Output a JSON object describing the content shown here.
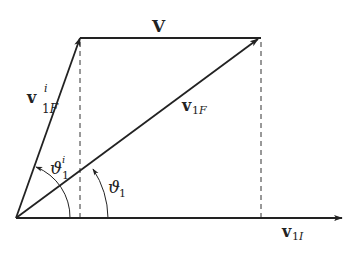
{
  "diagram": {
    "type": "vector-diagram",
    "colors": {
      "stroke": "#222222",
      "background": "#ffffff"
    },
    "labels": {
      "V": {
        "main": "V"
      },
      "v1F_i": {
        "main": "v",
        "sub": "1F",
        "sup": "i"
      },
      "v1F": {
        "main": "v",
        "sub": "1F"
      },
      "v1I": {
        "main": "v",
        "sub": "1I"
      },
      "theta1_i": {
        "main": "ϑ",
        "sub": "1",
        "sup": "i"
      },
      "theta1": {
        "main": "ϑ",
        "sub": "1"
      }
    },
    "vectors": [
      {
        "name": "v1F_i",
        "from": [
          16,
          218
        ],
        "to": [
          80,
          38
        ],
        "arrow": true
      },
      {
        "name": "V",
        "from": [
          80,
          38
        ],
        "to": [
          261,
          38
        ],
        "arrow": false
      },
      {
        "name": "v1F",
        "from": [
          16,
          218
        ],
        "to": [
          258,
          39
        ],
        "arrow": true
      },
      {
        "name": "v1I",
        "from": [
          16,
          218
        ],
        "to": [
          342,
          218
        ],
        "arrow": true
      }
    ],
    "dashed_lines": [
      {
        "from": [
          80,
          40
        ],
        "to": [
          80,
          218
        ]
      },
      {
        "from": [
          261,
          40
        ],
        "to": [
          261,
          218
        ]
      }
    ],
    "angle_arcs": [
      {
        "name": "theta1_i",
        "radius": 54
      },
      {
        "name": "theta1",
        "radius": 92
      }
    ]
  }
}
